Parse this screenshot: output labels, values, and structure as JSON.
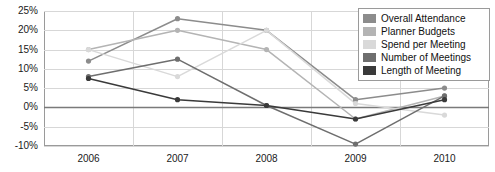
{
  "legend": {
    "position": "top-right",
    "entries": [
      {
        "label": "Overall Attendance",
        "color": "#8c8c8c"
      },
      {
        "label": "Planner Budgets",
        "color": "#b4b4b4"
      },
      {
        "label": "Spend per Meeting",
        "color": "#d9d9d9"
      },
      {
        "label": "Number of Meetings",
        "color": "#6e6e6e"
      },
      {
        "label": "Length of Meeting",
        "color": "#3a3a3a"
      }
    ]
  },
  "axes": {
    "y_ticks": [
      "25%",
      "20%",
      "15%",
      "10%",
      "5%",
      "0%",
      "-5%",
      "-10%"
    ],
    "x_ticks": [
      "2006",
      "2007",
      "2008",
      "2009",
      "2010"
    ]
  },
  "chart_data": {
    "type": "line",
    "title": "",
    "xlabel": "",
    "ylabel": "",
    "categories": [
      "2006",
      "2007",
      "2008",
      "2009",
      "2010"
    ],
    "x": [
      2006,
      2007,
      2008,
      2009,
      2010
    ],
    "ylim": [
      -10,
      25
    ],
    "ytick_values": [
      25,
      20,
      15,
      10,
      5,
      0,
      -5,
      -10
    ],
    "ytick_format": "percent",
    "grid": true,
    "zero_line": true,
    "legend_position": "top-right",
    "markers": true,
    "series": [
      {
        "name": "Overall Attendance",
        "color": "#8c8c8c",
        "values": [
          12,
          23,
          20,
          2,
          5
        ]
      },
      {
        "name": "Planner Budgets",
        "color": "#b4b4b4",
        "values": [
          15,
          20,
          15,
          -3,
          3
        ]
      },
      {
        "name": "Spend per Meeting",
        "color": "#d9d9d9",
        "values": [
          15,
          8,
          20,
          1,
          -2
        ]
      },
      {
        "name": "Number of Meetings",
        "color": "#6e6e6e",
        "values": [
          8,
          12.5,
          0.5,
          -9.5,
          3
        ]
      },
      {
        "name": "Length of Meeting",
        "color": "#3a3a3a",
        "values": [
          7.5,
          2,
          0.5,
          -3,
          2
        ]
      }
    ]
  }
}
